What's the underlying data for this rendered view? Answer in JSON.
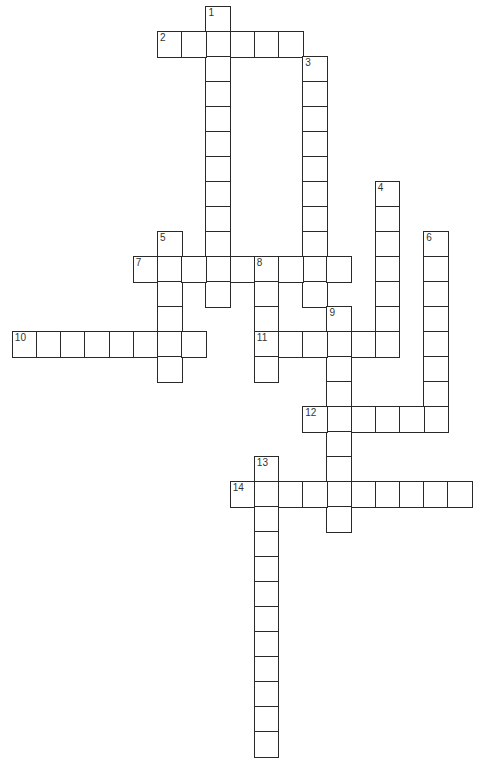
{
  "puzzle": {
    "grid_origin": {
      "x": 12.5,
      "y": 7
    },
    "cell_size": {
      "w": 24.2,
      "h": 25
    },
    "line_color": "#2a2a2a",
    "words": [
      {
        "number": "1",
        "direction": "down",
        "col": 8,
        "row": 0,
        "length": 12
      },
      {
        "number": "2",
        "direction": "across",
        "col": 6,
        "row": 1,
        "length": 6
      },
      {
        "number": "3",
        "direction": "down",
        "col": 12,
        "row": 2,
        "length": 10
      },
      {
        "number": "4",
        "direction": "down",
        "col": 15,
        "row": 7,
        "length": 7
      },
      {
        "number": "5",
        "direction": "down",
        "col": 6,
        "row": 9,
        "length": 6
      },
      {
        "number": "6",
        "direction": "down",
        "col": 17,
        "row": 9,
        "length": 8
      },
      {
        "number": "7",
        "direction": "across",
        "col": 5,
        "row": 10,
        "length": 9
      },
      {
        "number": "8",
        "direction": "down",
        "col": 10,
        "row": 10,
        "length": 5
      },
      {
        "number": "9",
        "direction": "down",
        "col": 13,
        "row": 12,
        "length": 9
      },
      {
        "number": "10",
        "direction": "across",
        "col": 0,
        "row": 13,
        "length": 8
      },
      {
        "number": "11",
        "direction": "across",
        "col": 10,
        "row": 13,
        "length": 6
      },
      {
        "number": "12",
        "direction": "across",
        "col": 12,
        "row": 16,
        "length": 6
      },
      {
        "number": "13",
        "direction": "down",
        "col": 10,
        "row": 18,
        "length": 12
      },
      {
        "number": "14",
        "direction": "across",
        "col": 9,
        "row": 19,
        "length": 10
      }
    ]
  }
}
